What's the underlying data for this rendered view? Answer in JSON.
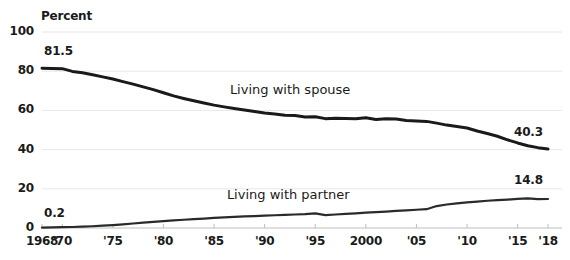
{
  "chart_data": {
    "type": "line",
    "title": "",
    "subtitle": "",
    "xlabel": "",
    "ylabel": "Percent",
    "ylim": [
      0,
      100
    ],
    "xlim": [
      1968,
      2018
    ],
    "grid": true,
    "legend_position": "inline-annotation",
    "y_ticks": [
      "0",
      "20",
      "40",
      "60",
      "80",
      "100"
    ],
    "y_tick_values": [
      0,
      20,
      40,
      60,
      80,
      100
    ],
    "x_ticks": [
      "1968",
      "'70",
      "'75",
      "'80",
      "'85",
      "'90",
      "'95",
      "2000",
      "'05",
      "'10",
      "'15",
      "'18"
    ],
    "x_tick_values": [
      1968,
      1970,
      1975,
      1980,
      1985,
      1990,
      1995,
      2000,
      2005,
      2010,
      2015,
      2018
    ],
    "annotations": [
      {
        "text": "81.5",
        "series": "Living with spouse",
        "x": 1968,
        "y": 81.5
      },
      {
        "text": "40.3",
        "series": "Living with spouse",
        "x": 2018,
        "y": 40.3
      },
      {
        "text": "0.2",
        "series": "Living with partner",
        "x": 1968,
        "y": 0.2
      },
      {
        "text": "14.8",
        "series": "Living with partner",
        "x": 2018,
        "y": 14.8
      }
    ],
    "x": [
      1968,
      1969,
      1970,
      1971,
      1972,
      1973,
      1974,
      1975,
      1976,
      1977,
      1978,
      1979,
      1980,
      1981,
      1982,
      1983,
      1984,
      1985,
      1986,
      1987,
      1988,
      1989,
      1990,
      1991,
      1992,
      1993,
      1994,
      1995,
      1996,
      1997,
      1998,
      1999,
      2000,
      2001,
      2002,
      2003,
      2004,
      2005,
      2006,
      2007,
      2008,
      2009,
      2010,
      2011,
      2012,
      2013,
      2014,
      2015,
      2016,
      2017,
      2018
    ],
    "series": [
      {
        "name": "Living with spouse",
        "color": "#1a1a1a",
        "values": [
          81.5,
          81.4,
          81.3,
          79.9,
          79.2,
          78.2,
          77.1,
          76.0,
          74.7,
          73.4,
          72.0,
          70.6,
          69.0,
          67.4,
          66.1,
          64.9,
          63.8,
          62.7,
          61.8,
          61.0,
          60.2,
          59.4,
          58.7,
          58.2,
          57.5,
          57.4,
          56.6,
          56.8,
          55.8,
          56.0,
          55.9,
          55.8,
          56.2,
          55.4,
          55.8,
          55.6,
          54.8,
          54.6,
          54.4,
          53.5,
          52.5,
          51.8,
          51.0,
          49.5,
          48.2,
          46.8,
          45.0,
          43.4,
          42.0,
          41.0,
          40.3
        ]
      },
      {
        "name": "Living with partner",
        "color": "#2a2a2a",
        "values": [
          0.2,
          0.3,
          0.4,
          0.5,
          0.7,
          0.9,
          1.2,
          1.5,
          1.9,
          2.3,
          2.7,
          3.1,
          3.5,
          3.9,
          4.2,
          4.5,
          4.8,
          5.2,
          5.4,
          5.7,
          5.9,
          6.1,
          6.3,
          6.5,
          6.7,
          6.9,
          7.1,
          7.5,
          6.6,
          6.9,
          7.2,
          7.5,
          7.8,
          8.1,
          8.4,
          8.7,
          9.0,
          9.3,
          9.6,
          11.2,
          12.0,
          12.6,
          13.1,
          13.5,
          13.9,
          14.2,
          14.5,
          14.9,
          15.1,
          14.7,
          14.8
        ]
      }
    ]
  },
  "labels": {
    "percent_unit": "Percent",
    "spouse_series_label": "Living with spouse",
    "partner_series_label": "Living with partner",
    "spouse_start_value": "81.5",
    "spouse_end_value": "40.3",
    "partner_start_value": "0.2",
    "partner_end_value": "14.8"
  },
  "colors": {
    "line": "#1a1a1a",
    "grid": "#e8e8e8",
    "axis": "#bdbdbd",
    "text": "#1a1a1a",
    "background": "#ffffff"
  }
}
